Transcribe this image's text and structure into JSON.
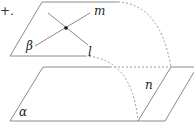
{
  "figure": {
    "partial_text": "+.",
    "planes": {
      "upper": {
        "label": "β"
      },
      "lower": {
        "label": "α"
      }
    },
    "lines": {
      "m": {
        "label": "m"
      },
      "l": {
        "label": "l"
      },
      "n": {
        "label": "n"
      }
    },
    "colors": {
      "stroke": "#8a8a8a",
      "dashed": "#9a9a9a",
      "point": "#111111",
      "text": "#222222"
    }
  }
}
